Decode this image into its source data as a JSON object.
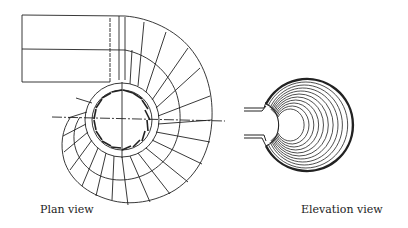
{
  "figure": {
    "plan_view": {
      "label": "Plan view",
      "components": [
        "inlet-duct",
        "spiral-casing",
        "wicket-gates",
        "center-line"
      ]
    },
    "elevation_view": {
      "label": "Elevation view",
      "components": [
        "casing-section-rings",
        "inlet-stubs"
      ]
    }
  }
}
